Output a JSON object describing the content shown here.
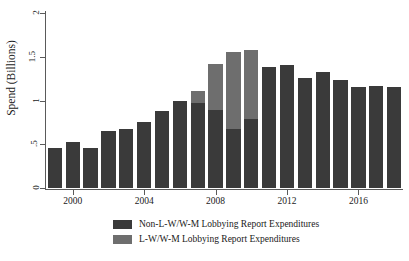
{
  "chart_data": {
    "type": "bar",
    "stacked": true,
    "title": "",
    "xlabel": "",
    "ylabel": "Spend (Billions)",
    "ylim": [
      0,
      2
    ],
    "yticks": [
      0,
      0.5,
      1,
      1.5,
      2
    ],
    "ytick_labels": [
      "0",
      ".5",
      "1",
      "1.5",
      "2"
    ],
    "xticks": [
      2000,
      2004,
      2008,
      2012,
      2016
    ],
    "xtick_labels": [
      "2000",
      "2004",
      "2008",
      "2012",
      "2016"
    ],
    "grid": false,
    "legend_position": "bottom",
    "categories": [
      1999,
      2000,
      2001,
      2002,
      2003,
      2004,
      2005,
      2006,
      2007,
      2008,
      2009,
      2010,
      2011,
      2012,
      2013,
      2014,
      2015,
      2016,
      2017,
      2018
    ],
    "series": [
      {
        "name": "Non-L-W/W-M Lobbying Report Expenditures",
        "color": "#3a3a3a",
        "values": [
          0.46,
          0.53,
          0.455,
          0.65,
          0.67,
          0.75,
          0.88,
          1.0,
          0.97,
          0.89,
          0.68,
          0.79,
          1.38,
          1.41,
          1.26,
          1.33,
          1.23,
          1.16,
          1.17,
          1.16
        ]
      },
      {
        "name": "L-W/W-M Lobbying Report Expenditures",
        "color": "#6e6e6e",
        "values": [
          0,
          0,
          0,
          0,
          0,
          0,
          0,
          0,
          0.14,
          0.53,
          0.87,
          0.79,
          0,
          0,
          0,
          0,
          0,
          0,
          0,
          0
        ]
      }
    ],
    "totals": [
      0.46,
      0.53,
      0.455,
      0.65,
      0.67,
      0.75,
      0.88,
      1.0,
      1.11,
      1.42,
      1.55,
      1.58,
      1.38,
      1.41,
      1.26,
      1.33,
      1.23,
      1.16,
      1.17,
      1.16
    ]
  },
  "legend": {
    "items": [
      {
        "label": "Non-L-W/W-M Lobbying Report Expenditures",
        "color": "#3a3a3a"
      },
      {
        "label": "L-W/W-M Lobbying Report Expenditures",
        "color": "#6e6e6e"
      }
    ]
  },
  "colors": {
    "axis": "#5a5a5a",
    "background": "#ffffff",
    "text": "#1a1a1a",
    "series_non_lwwm": "#3a3a3a",
    "series_lwwm": "#6e6e6e"
  }
}
